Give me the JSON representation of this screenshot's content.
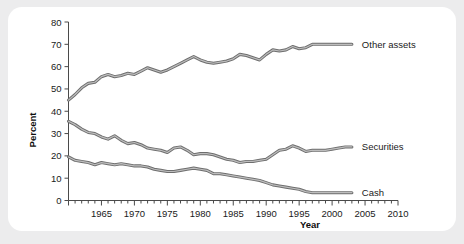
{
  "figure": {
    "background_color": "#ececed",
    "panel_color": "#ffffff",
    "line_color": "#6e6e6e"
  },
  "axes": {
    "ylabel": "Percent",
    "xlabel": "Year",
    "y_ticks": [
      "0",
      "10",
      "20",
      "30",
      "40",
      "50",
      "60",
      "70",
      "80"
    ],
    "x_ticks": [
      "1965",
      "1970",
      "1975",
      "1980",
      "1985",
      "1990",
      "1995",
      "2000",
      "2005",
      "2010"
    ]
  },
  "legend": {
    "other_assets": "Other assets",
    "securities": "Securities",
    "cash": "Cash"
  },
  "chart_data": {
    "type": "line",
    "title": "",
    "xlabel": "Year",
    "ylabel": "Percent",
    "xlim": [
      1960,
      2010
    ],
    "ylim": [
      0,
      80
    ],
    "grid": false,
    "legend_position": "right-inline",
    "x": [
      1960,
      1961,
      1962,
      1963,
      1964,
      1965,
      1966,
      1967,
      1968,
      1969,
      1970,
      1971,
      1972,
      1973,
      1974,
      1975,
      1976,
      1977,
      1978,
      1979,
      1980,
      1981,
      1982,
      1983,
      1984,
      1985,
      1986,
      1987,
      1988,
      1989,
      1990,
      1991,
      1992,
      1993,
      1994,
      1995,
      1996,
      1997,
      1998,
      1999,
      2000,
      2001,
      2002,
      2003
    ],
    "series": [
      {
        "name": "Other assets",
        "label": "Other assets",
        "values": [
          45.0,
          47.5,
          50.5,
          52.5,
          53.0,
          55.5,
          56.5,
          55.5,
          56.0,
          57.0,
          56.5,
          58.0,
          59.5,
          58.5,
          57.5,
          58.5,
          60.0,
          61.5,
          63.0,
          64.5,
          63.0,
          62.0,
          61.5,
          62.0,
          62.5,
          63.5,
          65.5,
          65.0,
          64.0,
          63.0,
          65.5,
          67.5,
          67.0,
          67.5,
          69.0,
          68.0,
          68.5,
          70.0,
          70.0,
          70.0,
          70.0,
          70.0,
          70.0,
          70.0
        ]
      },
      {
        "name": "Securities",
        "label": "Securities",
        "values": [
          35.5,
          34.0,
          32.0,
          30.5,
          30.0,
          28.5,
          27.5,
          29.0,
          27.0,
          25.5,
          26.0,
          25.0,
          23.5,
          23.0,
          22.5,
          21.5,
          23.5,
          24.0,
          22.5,
          20.5,
          21.0,
          21.0,
          20.5,
          19.5,
          18.5,
          18.0,
          17.0,
          17.5,
          17.5,
          18.0,
          18.5,
          20.5,
          22.5,
          23.0,
          24.5,
          23.5,
          22.0,
          22.5,
          22.5,
          22.5,
          23.0,
          23.5,
          24.0,
          24.0
        ]
      },
      {
        "name": "Cash",
        "label": "Cash",
        "values": [
          19.5,
          18.0,
          17.5,
          17.0,
          16.0,
          17.0,
          16.5,
          16.0,
          16.5,
          16.0,
          15.5,
          15.5,
          15.0,
          14.0,
          13.5,
          13.0,
          13.0,
          13.5,
          14.0,
          14.5,
          14.0,
          13.5,
          12.0,
          12.0,
          11.5,
          11.0,
          10.5,
          10.0,
          9.5,
          9.0,
          8.0,
          7.0,
          6.5,
          6.0,
          5.5,
          5.0,
          4.0,
          3.5,
          3.5,
          3.5,
          3.5,
          3.5,
          3.5,
          3.5
        ]
      }
    ]
  }
}
